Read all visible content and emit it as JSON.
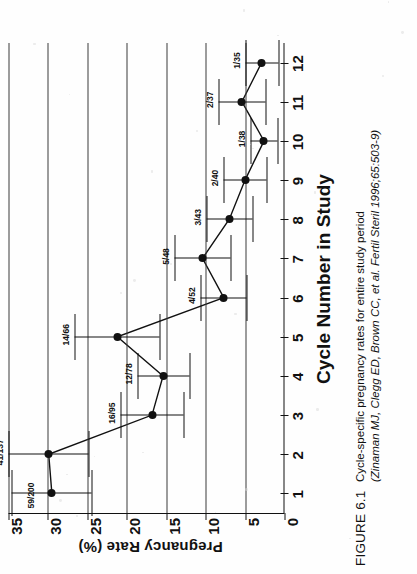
{
  "figure": {
    "number_label": "FIGURE 6.1",
    "caption_line1": "Cycle-specific pregnancy rates for entire study period",
    "caption_line2": "(Zinaman MJ, Clegg ED, Brown CC, et al. Fertil Steril 1996;65:503-9)"
  },
  "chart_data": {
    "type": "line",
    "title": "",
    "xlabel": "Cycle Number in Study",
    "ylabel": "Pregnancy Rate (%)",
    "categories": [
      "1",
      "2",
      "3",
      "4",
      "5",
      "6",
      "7",
      "8",
      "9",
      "10",
      "11",
      "12"
    ],
    "yticks": [
      "35",
      "30",
      "25",
      "20",
      "15",
      "10",
      "5",
      "0"
    ],
    "ylim": [
      0,
      35
    ],
    "grid": true,
    "legend": "none",
    "values": [
      29.5,
      29.9,
      16.8,
      15.4,
      21.2,
      7.7,
      10.4,
      7.0,
      5.0,
      2.6,
      5.4,
      2.9
    ],
    "errors_low": [
      24.5,
      24.8,
      12.8,
      12.1,
      15.8,
      4.8,
      6.8,
      4.1,
      2.3,
      0.9,
      2.4,
      0.8
    ],
    "errors_high": [
      34.6,
      35.0,
      20.8,
      18.7,
      26.6,
      10.6,
      14.0,
      9.9,
      7.7,
      4.3,
      8.4,
      5.0
    ],
    "point_labels": [
      "59/200",
      "41/137",
      "16/95",
      "12/78",
      "14/66",
      "4/52",
      "5/48",
      "3/43",
      "2/40",
      "1/38",
      "2/37",
      "1/35"
    ],
    "annotations": [
      {
        "cycle": "1",
        "label": "59/200",
        "numerator": 59,
        "denominator": 200,
        "rate": 29.5
      },
      {
        "cycle": "2",
        "label": "41/137",
        "numerator": 41,
        "denominator": 137,
        "rate": 29.9
      },
      {
        "cycle": "3",
        "label": "16/95",
        "numerator": 16,
        "denominator": 95,
        "rate": 16.8
      },
      {
        "cycle": "4",
        "label": "12/78",
        "numerator": 12,
        "denominator": 78,
        "rate": 15.4
      },
      {
        "cycle": "5",
        "label": "14/66",
        "numerator": 14,
        "denominator": 66,
        "rate": 21.2
      },
      {
        "cycle": "6",
        "label": "4/52",
        "numerator": 4,
        "denominator": 52,
        "rate": 7.7
      },
      {
        "cycle": "7",
        "label": "5/48",
        "numerator": 5,
        "denominator": 48,
        "rate": 10.4
      },
      {
        "cycle": "8",
        "label": "3/43",
        "numerator": 3,
        "denominator": 43,
        "rate": 7.0
      },
      {
        "cycle": "9",
        "label": "2/40",
        "numerator": 2,
        "denominator": 40,
        "rate": 5.0
      },
      {
        "cycle": "10",
        "label": "1/38",
        "numerator": 1,
        "denominator": 38,
        "rate": 2.6
      },
      {
        "cycle": "11",
        "label": "2/37",
        "numerator": 2,
        "denominator": 37,
        "rate": 5.4
      },
      {
        "cycle": "12",
        "label": "1/35",
        "numerator": 1,
        "denominator": 35,
        "rate": 2.9
      }
    ],
    "colors": {
      "line": "#111111",
      "marker": "#111111",
      "grid": "#3b3b3b",
      "axis": "#111111"
    }
  }
}
